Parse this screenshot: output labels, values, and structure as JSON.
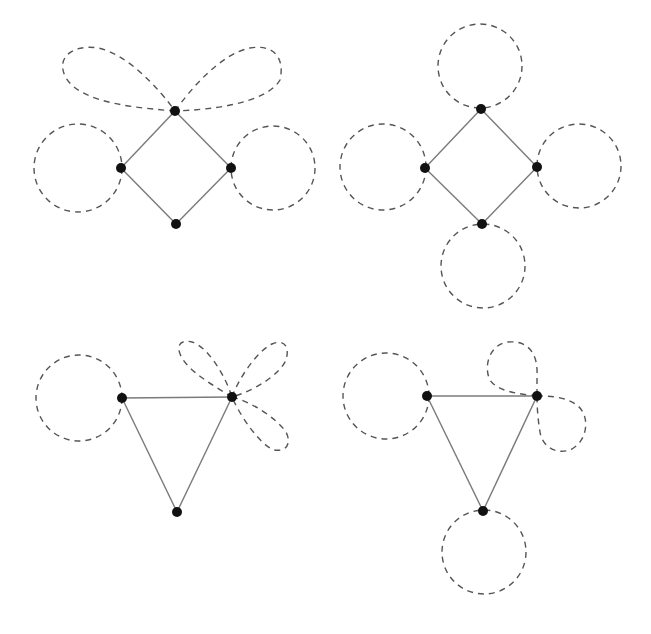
{
  "colors": {
    "background": "#ffffff",
    "edge": "#7a7a7a",
    "loop": "#555555",
    "vertex": "#111111"
  },
  "graphs": [
    {
      "id": "graph-square-petals",
      "shape": "square",
      "vertices": [
        {
          "id": "top",
          "x": 175,
          "y": 111
        },
        {
          "id": "left",
          "x": 121,
          "y": 168
        },
        {
          "id": "right",
          "x": 231,
          "y": 168
        },
        {
          "id": "bottom",
          "x": 176,
          "y": 224
        }
      ],
      "edges": [
        [
          "top",
          "left"
        ],
        [
          "top",
          "right"
        ],
        [
          "left",
          "bottom"
        ],
        [
          "right",
          "bottom"
        ]
      ],
      "loops": [
        {
          "vertex": "left",
          "type": "circle",
          "cx": 78,
          "cy": 168,
          "r": 44
        },
        {
          "vertex": "right",
          "type": "circle",
          "cx": 273,
          "cy": 168,
          "r": 42
        },
        {
          "vertex": "top",
          "type": "petal",
          "path": "M175,111 C140,108 82,104 66,78 C55,58 72,44 98,48 C128,54 160,90 175,111"
        },
        {
          "vertex": "top",
          "type": "petal",
          "path": "M175,111 C190,90 220,54 250,48 C274,44 285,58 280,80 C266,104 208,110 175,111"
        }
      ]
    },
    {
      "id": "graph-square-circles",
      "shape": "square",
      "vertices": [
        {
          "id": "top",
          "x": 481,
          "y": 109
        },
        {
          "id": "left",
          "x": 425,
          "y": 168
        },
        {
          "id": "right",
          "x": 537,
          "y": 167
        },
        {
          "id": "bottom",
          "x": 482,
          "y": 224
        }
      ],
      "edges": [
        [
          "top",
          "left"
        ],
        [
          "top",
          "right"
        ],
        [
          "left",
          "bottom"
        ],
        [
          "right",
          "bottom"
        ]
      ],
      "loops": [
        {
          "vertex": "top",
          "type": "circle",
          "cx": 480,
          "cy": 66,
          "r": 42
        },
        {
          "vertex": "left",
          "type": "circle",
          "cx": 383,
          "cy": 167,
          "r": 43
        },
        {
          "vertex": "right",
          "type": "circle",
          "cx": 579,
          "cy": 166,
          "r": 42
        },
        {
          "vertex": "bottom",
          "type": "circle",
          "cx": 483,
          "cy": 266,
          "r": 42
        }
      ]
    },
    {
      "id": "graph-triangle-petals",
      "shape": "triangle",
      "vertices": [
        {
          "id": "left",
          "x": 122,
          "y": 398
        },
        {
          "id": "right",
          "x": 232,
          "y": 397
        },
        {
          "id": "bottom",
          "x": 177,
          "y": 512
        }
      ],
      "edges": [
        [
          "left",
          "right"
        ],
        [
          "left",
          "bottom"
        ],
        [
          "right",
          "bottom"
        ]
      ],
      "loops": [
        {
          "vertex": "left",
          "type": "circle",
          "cx": 79,
          "cy": 398,
          "r": 43
        },
        {
          "vertex": "right",
          "type": "petal",
          "path": "M232,397 C214,386 190,372 182,358 C175,346 180,339 192,342 C206,346 224,372 232,397"
        },
        {
          "vertex": "right",
          "type": "petal",
          "path": "M232,397 C238,380 256,352 272,344 C284,339 290,346 286,360 C280,374 256,390 232,397"
        },
        {
          "vertex": "right",
          "type": "petal",
          "path": "M232,397 C252,402 276,418 286,432 C292,444 286,452 274,450 C262,446 242,420 232,397"
        }
      ]
    },
    {
      "id": "graph-triangle-mixed",
      "shape": "triangle",
      "vertices": [
        {
          "id": "left",
          "x": 427,
          "y": 396
        },
        {
          "id": "right",
          "x": 537,
          "y": 396
        },
        {
          "id": "bottom",
          "x": 483,
          "y": 511
        }
      ],
      "edges": [
        [
          "left",
          "right"
        ],
        [
          "left",
          "bottom"
        ],
        [
          "right",
          "bottom"
        ]
      ],
      "loops": [
        {
          "vertex": "left",
          "type": "circle",
          "cx": 386,
          "cy": 396,
          "r": 43
        },
        {
          "vertex": "bottom",
          "type": "circle",
          "cx": 484,
          "cy": 552,
          "r": 42
        },
        {
          "vertex": "right",
          "type": "petal",
          "path": "M537,396 C520,394 498,392 490,380 C483,366 490,344 508,342 C530,340 538,356 537,375 C537,384 537,390 537,396"
        },
        {
          "vertex": "right",
          "type": "petal",
          "path": "M537,396 C548,396 566,396 578,406 C590,416 588,440 572,449 C556,456 542,446 540,432 C538,420 537,408 537,396"
        }
      ]
    }
  ]
}
